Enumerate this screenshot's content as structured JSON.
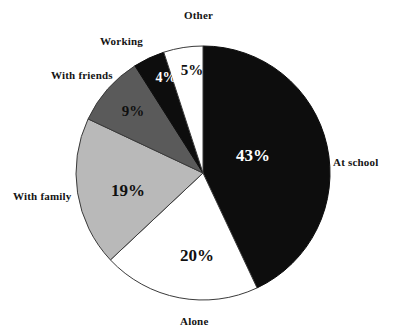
{
  "chart_data": {
    "type": "pie",
    "title": "",
    "subtitle": "",
    "xlabel": "",
    "ylabel": "",
    "legend_position": "outer-labels",
    "grid": false,
    "start_angle_deg": 0,
    "direction": "clockwise",
    "categories": [
      "At school",
      "Alone",
      "With family",
      "With friends",
      "Working",
      "Other"
    ],
    "values": [
      43,
      20,
      19,
      9,
      4,
      5
    ],
    "value_labels": [
      "43%",
      "20%",
      "19%",
      "9%",
      "4%",
      "5%"
    ],
    "units": "percent",
    "total": 100,
    "slices": [
      {
        "label": "At school",
        "value": 43,
        "value_label": "43%",
        "fill": "#0d0d0d",
        "stroke": "#0d0d0d",
        "text_color": "#ffffff",
        "start_deg": 0,
        "end_deg": 154.8,
        "outer_label_x": 333,
        "outer_label_y": 157,
        "value_x": 253,
        "value_y": 155,
        "value_size": "v-large"
      },
      {
        "label": "Alone",
        "value": 20,
        "value_label": "20%",
        "fill": "#ffffff",
        "stroke": "#3a3a3a",
        "text_color": "#101010",
        "start_deg": 154.8,
        "end_deg": 226.8,
        "outer_label_x": 180,
        "outer_label_y": 316,
        "value_x": 197,
        "value_y": 255,
        "value_size": "v-large"
      },
      {
        "label": "With family",
        "value": 19,
        "value_label": "19%",
        "fill": "#b9b9b9",
        "stroke": "#3a3a3a",
        "text_color": "#101010",
        "start_deg": 226.8,
        "end_deg": 295.2,
        "outer_label_x": 13,
        "outer_label_y": 191,
        "value_x": 128,
        "value_y": 190,
        "value_size": "v-large"
      },
      {
        "label": "With friends",
        "value": 9,
        "value_label": "9%",
        "fill": "#5a5a5a",
        "stroke": "#3a3a3a",
        "text_color": "#101010",
        "start_deg": 295.2,
        "end_deg": 327.6,
        "outer_label_x": 51,
        "outer_label_y": 70,
        "value_x": 133,
        "value_y": 111,
        "value_size": "v-mid"
      },
      {
        "label": "Working",
        "value": 4,
        "value_label": "4%",
        "fill": "#0d0d0d",
        "stroke": "#0d0d0d",
        "text_color": "#ffffff",
        "start_deg": 327.6,
        "end_deg": 342.0,
        "outer_label_x": 100,
        "outer_label_y": 36,
        "value_x": 166,
        "value_y": 78,
        "value_size": "v-small"
      },
      {
        "label": "Other",
        "value": 5,
        "value_label": "5%",
        "fill": "#ffffff",
        "stroke": "#3a3a3a",
        "text_color": "#101010",
        "start_deg": 342.0,
        "end_deg": 360.0,
        "outer_label_x": 184,
        "outer_label_y": 10,
        "value_x": 192,
        "value_y": 70,
        "value_size": "v-mid"
      }
    ],
    "geometry": {
      "center_x": 203,
      "center_y": 173,
      "radius": 127
    },
    "colors": {
      "black": "#0d0d0d",
      "dark_gray": "#5a5a5a",
      "light_gray": "#b9b9b9",
      "white": "#ffffff",
      "outline": "#3a3a3a",
      "background": "#ffffff",
      "label_text": "#141414"
    }
  }
}
